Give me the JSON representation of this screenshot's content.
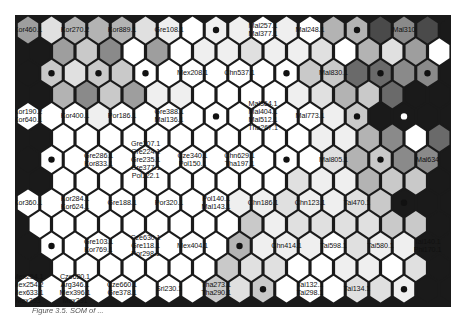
{
  "figure": {
    "type": "self-organizing-map-hexagonal-u-matrix",
    "caption": "Figure 3.5. SOM of ..."
  },
  "grid": {
    "rows": 13,
    "cols": 19,
    "shade_scale": [
      "#ffffff",
      "#efefef",
      "#e0e0e0",
      "#c9c9c9",
      "#b3b3b3",
      "#9e9e9e",
      "#8a8a8a",
      "#6a6a6a",
      "#4a4a4a",
      "#1a1a1a"
    ],
    "shades": [
      [
        5,
        2,
        4,
        4,
        4,
        2,
        1,
        0,
        1,
        1,
        0,
        1,
        0,
        4,
        4,
        8,
        6,
        8,
        9
      ],
      [
        9,
        5,
        3,
        6,
        0,
        5,
        0,
        1,
        1,
        2,
        1,
        1,
        2,
        0,
        4,
        2,
        5,
        0,
        9
      ],
      [
        9,
        3,
        2,
        3,
        3,
        0,
        0,
        0,
        0,
        0,
        0,
        0,
        3,
        3,
        7,
        7,
        6,
        6,
        9
      ],
      [
        9,
        4,
        6,
        3,
        5,
        1,
        1,
        0,
        0,
        0,
        0,
        1,
        2,
        4,
        3,
        7,
        9,
        9,
        9
      ],
      [
        0,
        0,
        0,
        1,
        0,
        0,
        0,
        0,
        0,
        0,
        0,
        0,
        0,
        1,
        3,
        9,
        9,
        9,
        9
      ],
      [
        9,
        0,
        0,
        0,
        0,
        0,
        0,
        0,
        0,
        0,
        0,
        0,
        1,
        1,
        4,
        6,
        0,
        7,
        9
      ],
      [
        9,
        0,
        0,
        0,
        0,
        0,
        0,
        0,
        0,
        0,
        0,
        0,
        0,
        2,
        4,
        3,
        6,
        6,
        9
      ],
      [
        9,
        0,
        0,
        0,
        0,
        0,
        0,
        0,
        0,
        0,
        0,
        2,
        1,
        1,
        4,
        3,
        3,
        9,
        9
      ],
      [
        0,
        0,
        0,
        0,
        0,
        0,
        0,
        0,
        0,
        1,
        1,
        2,
        1,
        1,
        2,
        3,
        9,
        9,
        9
      ],
      [
        0,
        0,
        0,
        0,
        0,
        0,
        0,
        0,
        0,
        3,
        1,
        2,
        2,
        2,
        2,
        3,
        3,
        9,
        9
      ],
      [
        9,
        0,
        0,
        0,
        0,
        0,
        0,
        0,
        0,
        4,
        1,
        1,
        1,
        0,
        2,
        1,
        1,
        9,
        9
      ],
      [
        9,
        0,
        0,
        0,
        0,
        0,
        0,
        0,
        3,
        2,
        2,
        0,
        0,
        1,
        1,
        0,
        2,
        9,
        9
      ],
      [
        0,
        0,
        0,
        0,
        0,
        0,
        0,
        0,
        3,
        2,
        3,
        0,
        0,
        0,
        2,
        2,
        1,
        9,
        9
      ]
    ]
  },
  "nodes": [
    {
      "row": 0,
      "col": 0,
      "labels": [
        "Kor460.1"
      ]
    },
    {
      "row": 0,
      "col": 2,
      "labels": [
        "Kor270.2"
      ]
    },
    {
      "row": 0,
      "col": 4,
      "labels": [
        "Kor889.1"
      ]
    },
    {
      "row": 0,
      "col": 6,
      "labels": [
        "Gre108.1"
      ]
    },
    {
      "row": 0,
      "col": 8,
      "dot": true
    },
    {
      "row": 0,
      "col": 10,
      "labels": [
        "Mal257.1",
        "Mal377.1"
      ]
    },
    {
      "row": 0,
      "col": 12,
      "labels": [
        "Mal248.1"
      ]
    },
    {
      "row": 0,
      "col": 14,
      "dot": true
    },
    {
      "row": 0,
      "col": 16,
      "labels": [
        "Mal310"
      ]
    },
    {
      "row": 2,
      "col": 1,
      "dot": true
    },
    {
      "row": 2,
      "col": 3,
      "dot": true
    },
    {
      "row": 2,
      "col": 5,
      "dot": true
    },
    {
      "row": 2,
      "col": 7,
      "labels": [
        "Mex208.1"
      ]
    },
    {
      "row": 2,
      "col": 9,
      "labels": [
        "Chn537.1"
      ]
    },
    {
      "row": 2,
      "col": 11,
      "dot": true
    },
    {
      "row": 2,
      "col": 13,
      "labels": [
        "Mal830.1"
      ]
    },
    {
      "row": 2,
      "col": 15,
      "dot": true
    },
    {
      "row": 2,
      "col": 17,
      "dot": true
    },
    {
      "row": 4,
      "col": 0,
      "labels": [
        "Kor190.2",
        "Kor640.1"
      ]
    },
    {
      "row": 4,
      "col": 2,
      "labels": [
        "Kor400.1"
      ]
    },
    {
      "row": 4,
      "col": 4,
      "labels": [
        "Por186.1"
      ]
    },
    {
      "row": 4,
      "col": 6,
      "labels": [
        "Gre388.1",
        "Mal136.1"
      ]
    },
    {
      "row": 4,
      "col": 8,
      "dot": true
    },
    {
      "row": 4,
      "col": 10,
      "labels": [
        "Mal364.1",
        "Mal404.1",
        "Mal512.1",
        "Tha267.1"
      ]
    },
    {
      "row": 4,
      "col": 12,
      "labels": [
        "Mal773.1"
      ]
    },
    {
      "row": 4,
      "col": 14,
      "dot": true
    },
    {
      "row": 4,
      "col": 16,
      "dot": true,
      "dot_color": "white"
    },
    {
      "row": 6,
      "col": 1,
      "dot": true
    },
    {
      "row": 6,
      "col": 3,
      "labels": [
        "Gre286.1",
        "Kor833.1"
      ]
    },
    {
      "row": 6,
      "col": 5,
      "labels": [
        "Gre107.1",
        "Gre224.1",
        "Gre235.1",
        "Gre377.1",
        "Pol122.1"
      ]
    },
    {
      "row": 6,
      "col": 7,
      "labels": [
        "Cze340.1",
        "Pol150.1"
      ]
    },
    {
      "row": 6,
      "col": 9,
      "labels": [
        "Chn629.1",
        "Tha197.1"
      ]
    },
    {
      "row": 6,
      "col": 11,
      "dot": true
    },
    {
      "row": 6,
      "col": 13,
      "labels": [
        "Mal805.1"
      ]
    },
    {
      "row": 6,
      "col": 15,
      "dot": true
    },
    {
      "row": 6,
      "col": 17,
      "labels": [
        "Mal634"
      ]
    },
    {
      "row": 8,
      "col": 0,
      "labels": [
        "Kor360.1"
      ]
    },
    {
      "row": 8,
      "col": 2,
      "labels": [
        "Kor284.1",
        "Kor624.1"
      ]
    },
    {
      "row": 8,
      "col": 4,
      "labels": [
        "Gre188.1"
      ]
    },
    {
      "row": 8,
      "col": 6,
      "labels": [
        "Por320.1"
      ]
    },
    {
      "row": 8,
      "col": 8,
      "labels": [
        "Pol140.1",
        "Mal143.1"
      ]
    },
    {
      "row": 8,
      "col": 10,
      "labels": [
        "Chn186.1"
      ]
    },
    {
      "row": 8,
      "col": 12,
      "labels": [
        "Chn123.1"
      ]
    },
    {
      "row": 8,
      "col": 14,
      "labels": [
        "Tai470.1"
      ]
    },
    {
      "row": 8,
      "col": 16,
      "dot": true
    },
    {
      "row": 10,
      "col": 1,
      "dot": true
    },
    {
      "row": 10,
      "col": 3,
      "labels": [
        "Gre103.1",
        "Kor769.1"
      ]
    },
    {
      "row": 10,
      "col": 5,
      "labels": [
        "Cze630.1",
        "Gre118.1",
        "Por298.1"
      ]
    },
    {
      "row": 10,
      "col": 7,
      "labels": [
        "Mex404.1"
      ]
    },
    {
      "row": 10,
      "col": 9,
      "dot": true
    },
    {
      "row": 10,
      "col": 11,
      "labels": [
        "Chn414.1"
      ]
    },
    {
      "row": 10,
      "col": 13,
      "labels": [
        "Tai598.1"
      ]
    },
    {
      "row": 10,
      "col": 15,
      "labels": [
        "Tai580.1"
      ]
    },
    {
      "row": 10,
      "col": 17,
      "labels": [
        "Tai140.1",
        "Phi170.1"
      ]
    },
    {
      "row": 12,
      "col": 0,
      "labels": [
        "Mex254.1",
        "Mex254.2",
        "Mex633.1",
        "Mex393"
      ]
    },
    {
      "row": 12,
      "col": 2,
      "labels": [
        "Cze620.1",
        "Arg346.1",
        "Mex396.1",
        "Mex391"
      ]
    },
    {
      "row": 12,
      "col": 4,
      "labels": [
        "Cze660.1",
        "Gre378.1"
      ]
    },
    {
      "row": 12,
      "col": 6,
      "labels": [
        "Sri230.1"
      ]
    },
    {
      "row": 12,
      "col": 8,
      "labels": [
        "Tha273.1",
        "Tha290.1"
      ]
    },
    {
      "row": 12,
      "col": 10,
      "dot": true
    },
    {
      "row": 12,
      "col": 12,
      "labels": [
        "Tai132.1",
        "Tai298.1"
      ]
    },
    {
      "row": 12,
      "col": 14,
      "labels": [
        "Tai134.1"
      ]
    },
    {
      "row": 12,
      "col": 16,
      "dot": true
    }
  ]
}
